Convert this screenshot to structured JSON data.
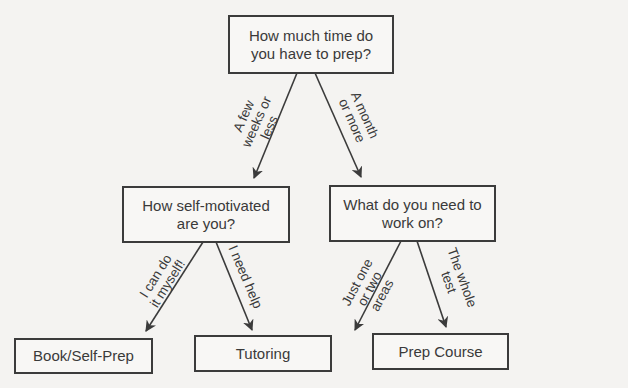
{
  "nodes": {
    "root": {
      "text_line1": "How much time do",
      "text_line2": "you have to prep?"
    },
    "self_motivated": {
      "text_line1": "How self-motivated",
      "text_line2": "are you?"
    },
    "work_on": {
      "text_line1": "What do you need to",
      "text_line2": "work on?"
    },
    "book": {
      "text": "Book/Self-Prep"
    },
    "tutoring": {
      "text": "Tutoring"
    },
    "prep_course": {
      "text": "Prep Course"
    }
  },
  "edges": {
    "few_weeks": {
      "line1": "A few",
      "line2": "weeks or",
      "line3": "less"
    },
    "month_more": {
      "line1": "A month",
      "line2": "or more"
    },
    "can_do": {
      "line1": "I can do",
      "line2": "it myself!"
    },
    "need_help": {
      "line1": "I need help"
    },
    "one_two": {
      "line1": "Just one",
      "line2": "or two",
      "line3": "areas"
    },
    "whole_test": {
      "line1": "The whole",
      "line2": "test"
    }
  },
  "colors": {
    "line": "#3b3b3b",
    "background": "#f4f3f1"
  }
}
